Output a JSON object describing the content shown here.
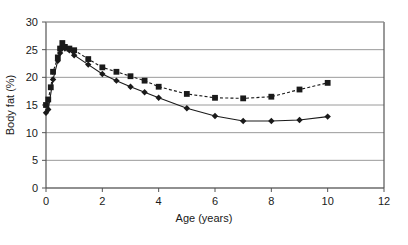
{
  "chart_data": {
    "type": "line",
    "title": "",
    "xlabel": "Age (years)",
    "ylabel": "Body fat (%)",
    "xlim": [
      0,
      12
    ],
    "ylim": [
      0,
      30
    ],
    "xticks": [
      0,
      2,
      4,
      6,
      8,
      10,
      12
    ],
    "yticks": [
      0,
      5,
      10,
      15,
      20,
      25,
      30
    ],
    "grid": "horizontal",
    "legend_position": "none",
    "series": [
      {
        "name": "boys",
        "marker": "diamond",
        "linestyle": "solid",
        "color": "#1a1a1a",
        "points": [
          [
            0.0,
            13.6
          ],
          [
            0.08,
            14.2
          ],
          [
            0.25,
            19.6
          ],
          [
            0.42,
            23.0
          ],
          [
            0.5,
            24.4
          ],
          [
            0.58,
            25.6
          ],
          [
            0.67,
            25.2
          ],
          [
            0.83,
            24.9
          ],
          [
            1.0,
            24.0
          ],
          [
            1.5,
            22.3
          ],
          [
            2.0,
            20.6
          ],
          [
            2.5,
            19.4
          ],
          [
            3.0,
            18.3
          ],
          [
            3.5,
            17.3
          ],
          [
            4.0,
            16.3
          ],
          [
            5.0,
            14.4
          ],
          [
            6.0,
            13.0
          ],
          [
            7.0,
            12.1
          ],
          [
            8.0,
            12.1
          ],
          [
            9.0,
            12.3
          ],
          [
            10.0,
            12.9
          ]
        ]
      },
      {
        "name": "girls",
        "marker": "square",
        "linestyle": "dotted",
        "color": "#1a1a1a",
        "points": [
          [
            0.0,
            15.0
          ],
          [
            0.08,
            16.0
          ],
          [
            0.17,
            18.2
          ],
          [
            0.25,
            21.0
          ],
          [
            0.42,
            23.6
          ],
          [
            0.5,
            25.2
          ],
          [
            0.58,
            26.2
          ],
          [
            0.67,
            25.5
          ],
          [
            0.83,
            25.2
          ],
          [
            1.0,
            24.9
          ],
          [
            1.5,
            23.3
          ],
          [
            2.0,
            21.8
          ],
          [
            2.5,
            21.0
          ],
          [
            3.0,
            20.2
          ],
          [
            3.5,
            19.4
          ],
          [
            4.0,
            18.3
          ],
          [
            5.0,
            17.0
          ],
          [
            6.0,
            16.3
          ],
          [
            7.0,
            16.2
          ],
          [
            8.0,
            16.5
          ],
          [
            9.0,
            17.8
          ],
          [
            10.0,
            19.0
          ]
        ]
      }
    ]
  },
  "axes": {
    "x_tick_labels": [
      "0",
      "2",
      "4",
      "6",
      "8",
      "10",
      "12"
    ],
    "y_tick_labels": [
      "0",
      "5",
      "10",
      "15",
      "20",
      "25",
      "30"
    ],
    "x_axis_title": "Age (years)",
    "y_axis_title": "Body fat (%)"
  },
  "colors": {
    "ink": "#1a1a1a",
    "grid": "#9a9a9a",
    "axis": "#555555",
    "background": "#ffffff"
  }
}
